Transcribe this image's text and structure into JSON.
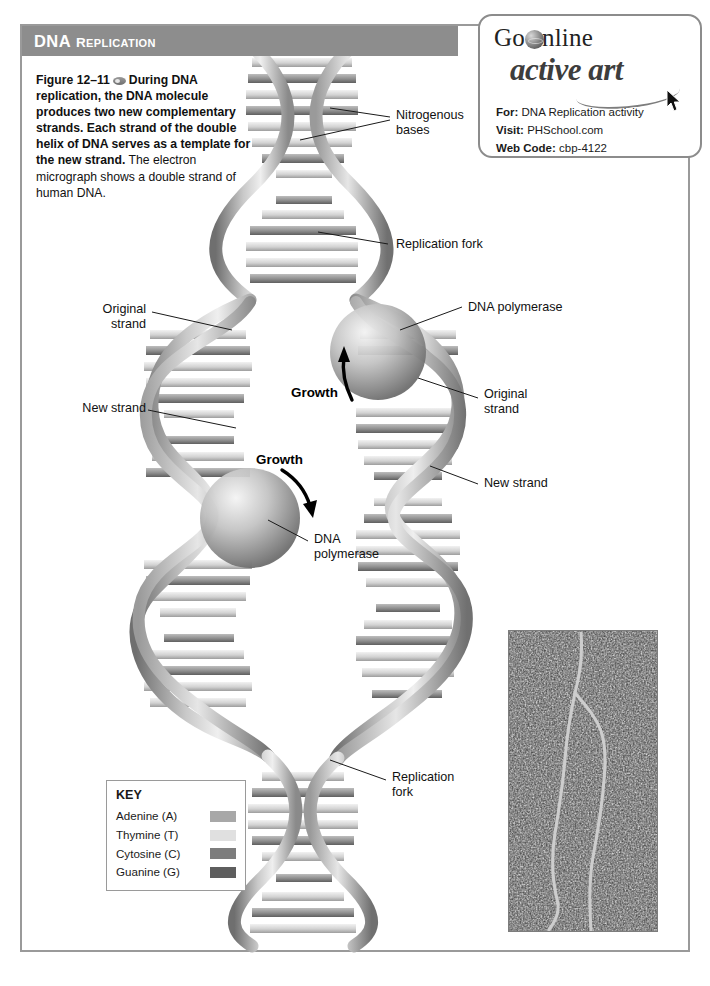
{
  "header": {
    "title_main": "DNA",
    "title_rest": "REPLICATION"
  },
  "caption": {
    "figure_label": "Figure 12–11",
    "bold_text": "During DNA replication, the DNA molecule produces two new complementary strands. Each strand of the double helix of DNA serves as a template for the new strand.",
    "plain_text": " The electron micrograph shows a double strand of human DNA."
  },
  "go_online": {
    "go_text": "Go",
    "online_text": "nline",
    "active_art": "active art",
    "rows": [
      {
        "label": "For:",
        "value": "DNA Replication activity"
      },
      {
        "label": "Visit:",
        "value": "PHSchool.com"
      },
      {
        "label": "Web Code:",
        "value": "cbp-4122"
      }
    ]
  },
  "labels": {
    "nitrogenous_bases": "Nitrogenous\nbases",
    "replication_fork_top": "Replication fork",
    "dna_polymerase_right": "DNA polymerase",
    "original_strand_left": "Original\nstrand",
    "original_strand_right": "Original\nstrand",
    "new_strand_left": "New strand",
    "new_strand_right": "New strand",
    "dna_polymerase_center": "DNA\npolymerase",
    "replication_fork_bottom": "Replication\nfork",
    "growth_upper": "Growth",
    "growth_lower": "Growth"
  },
  "key": {
    "title": "KEY",
    "items": [
      {
        "name": "Adenine (A)",
        "color": "#a8a8a8"
      },
      {
        "name": "Thymine (T)",
        "color": "#e0e0e0"
      },
      {
        "name": "Cytosine (C)",
        "color": "#7d7d7d"
      },
      {
        "name": "Guanine (G)",
        "color": "#5e5e5e"
      }
    ]
  },
  "colors": {
    "header_bar": "#8d8d8d",
    "frame_border": "#9a9a9a",
    "strand_light": "#d6d6d6",
    "strand_dark": "#8e8e8e",
    "micrograph_bg": "#4c4c4c",
    "micrograph_strand": "#c9c9c9"
  }
}
